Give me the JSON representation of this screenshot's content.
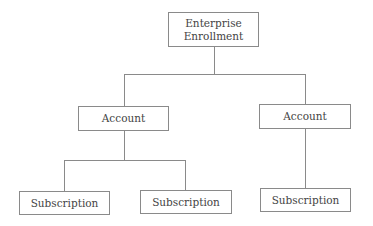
{
  "diagram": {
    "type": "hierarchy",
    "root": {
      "label_line1": "Enterprise",
      "label_line2": "Enrollment"
    },
    "accounts": [
      {
        "label": "Account"
      },
      {
        "label": "Account"
      }
    ],
    "subscriptions": [
      {
        "label": "Subscription",
        "parent": 0
      },
      {
        "label": "Subscription",
        "parent": 0
      },
      {
        "label": "Subscription",
        "parent": 1
      }
    ],
    "colors": {
      "line": "#8a8a8a",
      "text": "#444444",
      "background": "#ffffff"
    }
  }
}
